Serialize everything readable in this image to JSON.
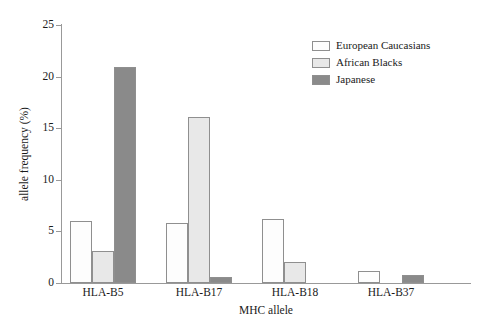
{
  "chart_data": {
    "type": "bar",
    "title": "",
    "xlabel": "MHC allele",
    "ylabel": "allele frequency (%)",
    "categories": [
      "HLA-B5",
      "HLA-B17",
      "HLA-B18",
      "HLA-B37"
    ],
    "series": [
      {
        "name": "European Caucasians",
        "color": "#fdfdfd",
        "values": [
          6.0,
          5.8,
          6.2,
          1.2
        ]
      },
      {
        "name": "African Blacks",
        "color": "#e8e8e8",
        "values": [
          3.1,
          16.1,
          2.0,
          0.0
        ]
      },
      {
        "name": "Japanese",
        "color": "#8a8a8a",
        "values": [
          20.9,
          0.6,
          0.0,
          0.8
        ]
      }
    ],
    "ylim": [
      0,
      25
    ],
    "yticks": [
      0,
      5,
      10,
      15,
      20,
      25
    ],
    "ytick_labels": [
      "0",
      "5",
      "10",
      "15",
      "20",
      "25"
    ],
    "grid": false,
    "legend_position": "top-right",
    "bar_edge_color": "#8f8f8f",
    "axis_color": "#999999"
  },
  "legend": {
    "entries": [
      {
        "label": "European Caucasians"
      },
      {
        "label": "African Blacks"
      },
      {
        "label": "Japanese"
      }
    ]
  }
}
